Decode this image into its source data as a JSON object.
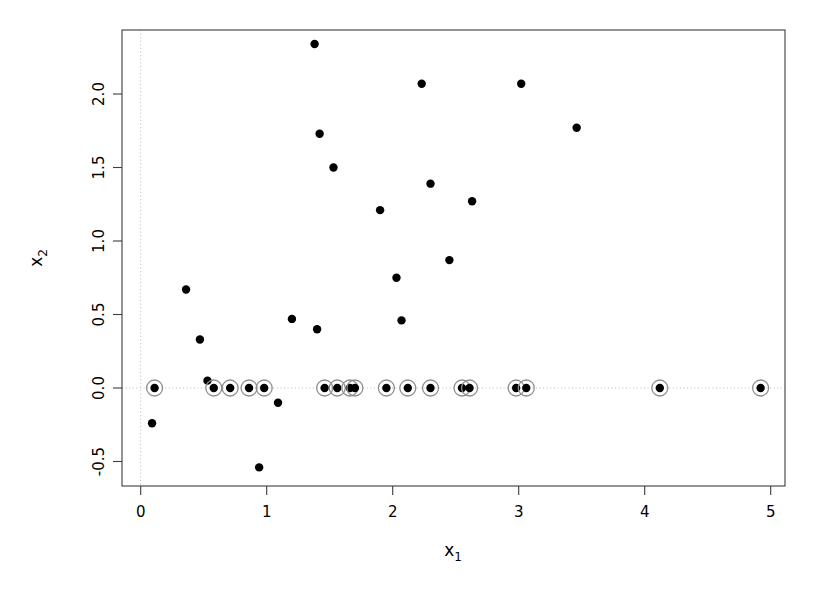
{
  "chart_data": {
    "type": "scatter",
    "title": "",
    "xlabel": "x_1",
    "ylabel": "x_2",
    "xlabel_base": "x",
    "xlabel_sub": "1",
    "ylabel_base": "x",
    "ylabel_sub": "2",
    "xlim": [
      -0.14,
      5.11
    ],
    "ylim": [
      -0.72,
      2.48
    ],
    "xticks": [
      0,
      1,
      2,
      3,
      4,
      5
    ],
    "xtick_labels": [
      "0",
      "1",
      "2",
      "3",
      "4",
      "5"
    ],
    "yticks": [
      -0.5,
      0.0,
      0.5,
      1.0,
      1.5,
      2.0
    ],
    "ytick_labels": [
      "-0.5",
      "0.0",
      "0.5",
      "1.0",
      "1.5",
      "2.0"
    ],
    "grid": false,
    "guides": {
      "vertical_at_x": 0,
      "horizontal_at_y": 0,
      "style": "dotted",
      "color": "#b9b9b9"
    },
    "legend": null,
    "point_color": "#000000",
    "ring_color": "#8e8e8e",
    "marker_radius_px": 4.2,
    "ring_radius_px": 8.0,
    "series": [
      {
        "name": "unhighlighted",
        "marker": "filled-circle",
        "points": [
          [
            0.09,
            -0.24
          ],
          [
            0.36,
            0.67
          ],
          [
            0.47,
            0.33
          ],
          [
            0.53,
            0.05
          ],
          [
            0.94,
            -0.54
          ],
          [
            1.09,
            -0.1
          ],
          [
            1.2,
            0.47
          ],
          [
            1.38,
            2.34
          ],
          [
            1.4,
            0.4
          ],
          [
            1.42,
            1.73
          ],
          [
            1.53,
            1.5
          ],
          [
            1.9,
            1.21
          ],
          [
            2.03,
            0.75
          ],
          [
            2.07,
            0.46
          ],
          [
            2.23,
            2.07
          ],
          [
            2.3,
            1.39
          ],
          [
            2.45,
            0.87
          ],
          [
            2.63,
            1.27
          ],
          [
            3.02,
            2.07
          ],
          [
            3.46,
            1.77
          ]
        ]
      },
      {
        "name": "highlighted-at-zero",
        "marker": "filled-circle-with-ring",
        "points": [
          [
            0.11,
            0.0
          ],
          [
            0.58,
            0.0
          ],
          [
            0.71,
            0.0
          ],
          [
            0.86,
            0.0
          ],
          [
            0.98,
            0.0
          ],
          [
            1.46,
            0.0
          ],
          [
            1.56,
            0.0
          ],
          [
            1.66,
            0.0
          ],
          [
            1.7,
            0.0
          ],
          [
            1.95,
            0.0
          ],
          [
            2.12,
            0.0
          ],
          [
            2.3,
            0.0
          ],
          [
            2.55,
            0.0
          ],
          [
            2.61,
            0.0
          ],
          [
            2.98,
            0.0
          ],
          [
            3.06,
            0.0
          ],
          [
            4.12,
            0.0
          ],
          [
            4.92,
            0.0
          ]
        ]
      }
    ]
  },
  "figure": {
    "background": "#ffffff",
    "frame_color": "#3c3c3c"
  }
}
